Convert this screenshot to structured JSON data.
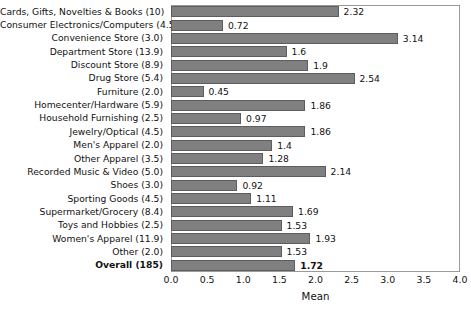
{
  "chart_data": {
    "type": "bar",
    "orientation": "horizontal",
    "title": "",
    "xlabel": "Mean",
    "ylabel": "",
    "xlim": [
      0.0,
      4.0
    ],
    "xticks": [
      "0.0",
      "0.5",
      "1.0",
      "1.5",
      "2.0",
      "2.5",
      "3.0",
      "3.5",
      "4.0"
    ],
    "grid": false,
    "legend": null,
    "bar_color": "#808080",
    "bar_edge_color": "#5d5d5d",
    "categories": [
      "Cards, Gifts, Novelties & Books (10)",
      "Consumer Electronics/Computers (4.5)",
      "Convenience Store (3.0)",
      "Department Store (13.9)",
      "Discount Store (8.9)",
      "Drug Store (5.4)",
      "Furniture (2.0)",
      "Homecenter/Hardware (5.9)",
      "Household Furnishing (2.5)",
      "Jewelry/Optical (4.5)",
      "Men's Apparel (2.0)",
      "Other Apparel (3.5)",
      "Recorded Music & Video (5.0)",
      "Shoes (3.0)",
      "Sporting Goods (4.5)",
      "Supermarket/Grocery (8.4)",
      "Toys and Hobbies (2.5)",
      "Women's Apparel (11.9)",
      "Other (2.0)",
      "Overall (185)"
    ],
    "values": [
      2.32,
      0.72,
      3.14,
      1.6,
      1.9,
      2.54,
      0.45,
      1.86,
      0.97,
      1.86,
      1.4,
      1.28,
      2.14,
      0.92,
      1.11,
      1.69,
      1.53,
      1.93,
      1.53,
      1.72
    ],
    "value_labels": [
      "2.32",
      "0.72",
      "3.14",
      "1.6",
      "1.9",
      "2.54",
      "0.45",
      "1.86",
      "0.97",
      "1.86",
      "1.4",
      "1.28",
      "2.14",
      "0.92",
      "1.11",
      "1.69",
      "1.53",
      "1.93",
      "1.53",
      "1.72"
    ],
    "bold_categories": [
      "Overall (185)"
    ]
  }
}
